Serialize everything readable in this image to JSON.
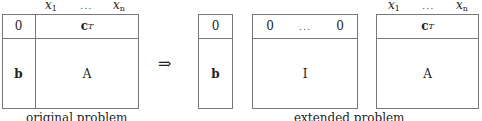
{
  "original": {
    "header": {
      "x_first": "x",
      "x_first_sub": "1",
      "dots": "...",
      "x_last": "x",
      "x_last_sub": "n"
    },
    "top_left": "0",
    "top_right": "c",
    "top_right_sup": "T",
    "bottom_left": "b",
    "bottom_right": "A",
    "caption": "original problem"
  },
  "arrow": "⇒",
  "extended": {
    "rhs": {
      "top": "0",
      "bottom": "b"
    },
    "identity": {
      "top_first": "0",
      "top_dots": "...",
      "top_last": "0",
      "body": "I"
    },
    "matrix": {
      "header": {
        "x_first": "x",
        "x_first_sub": "1",
        "dots": "...",
        "x_last": "x",
        "x_last_sub": "n"
      },
      "top": "c",
      "top_sup": "T",
      "body": "A"
    },
    "caption": "extended problem"
  },
  "colors": {
    "line": "#777777",
    "text": "#222222",
    "background": "#ffffff"
  }
}
